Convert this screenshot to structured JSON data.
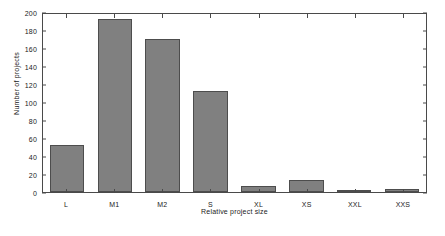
{
  "chart_data": {
    "type": "bar",
    "title": "",
    "xlabel": "Relative project size",
    "ylabel": "Number of projects",
    "categories": [
      "L",
      "M1",
      "M2",
      "S",
      "XL",
      "XS",
      "XXL",
      "XXS"
    ],
    "values": [
      52,
      192,
      170,
      112,
      7,
      13,
      1,
      3
    ],
    "ylim": [
      0,
      200
    ],
    "yticks": [
      0,
      20,
      40,
      60,
      80,
      100,
      120,
      140,
      160,
      180,
      200
    ],
    "ytick_labels": [
      "0",
      "20",
      "40",
      "60",
      "80",
      "100",
      "120",
      "140",
      "160",
      "180",
      "200"
    ],
    "grid": false,
    "legend": null,
    "bar_color": "#808080",
    "bar_edge_color": "#4d4d4d",
    "axes_color": "#4a4a4a",
    "background_color": "#ffffff"
  }
}
